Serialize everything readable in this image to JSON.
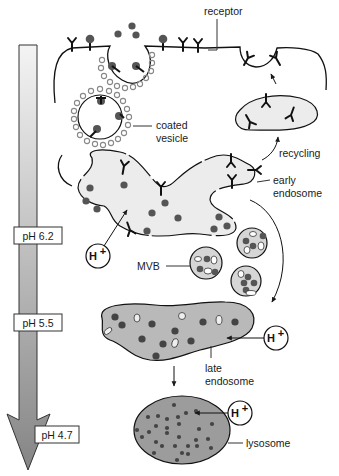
{
  "diagram": {
    "labels": {
      "receptor": "receptor",
      "coated_vesicle_1": "coated",
      "coated_vesicle_2": "vesicle",
      "recycling": "recycling",
      "early_endosome_1": "early",
      "early_endosome_2": "endosome",
      "mvb": "MVB",
      "late_endosome_1": "late",
      "late_endosome_2": "endosome",
      "lysosome": "lysosome"
    },
    "proton": {
      "base": "H",
      "sup": "+"
    },
    "ph_scale": {
      "levels": [
        {
          "label": "pH 6.2",
          "stage": "early endosome"
        },
        {
          "label": "pH 5.5",
          "stage": "late endosome"
        },
        {
          "label": "pH 4.7",
          "stage": "lysosome"
        }
      ],
      "gradient_top": "#f2f2f2",
      "gradient_bottom": "#8a8a8a"
    },
    "colors": {
      "early_endosome_fill": "#ececec",
      "late_endosome_fill": "#b9b9b9",
      "lysosome_fill": "#9c9c9c",
      "ligand": "#555555",
      "outline": "#1a1a1a",
      "clathrin": "#8c8c8c"
    }
  }
}
